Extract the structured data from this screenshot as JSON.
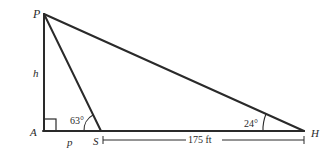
{
  "diagram": {
    "type": "right-triangle-geometry",
    "points": {
      "P": {
        "label": "P",
        "x": 44,
        "y": 14
      },
      "A": {
        "label": "A",
        "x": 43,
        "y": 131
      },
      "S": {
        "label": "S",
        "x": 101,
        "y": 131
      },
      "H": {
        "label": "H",
        "x": 304,
        "y": 131
      }
    },
    "segments": [
      "PA",
      "PS",
      "PH",
      "AH"
    ],
    "labels": {
      "height": "h",
      "base_left": "p",
      "angle_S": "63°",
      "angle_H": "24°",
      "distance_SH": "175 ft"
    },
    "right_angle_at": "A",
    "colors": {
      "stroke": "#2a2a2a",
      "background": "#ffffff"
    }
  }
}
